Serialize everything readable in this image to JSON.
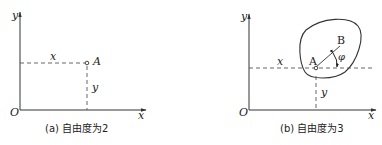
{
  "panels": [
    {
      "id": "a",
      "axis_y_label": "y",
      "axis_x_label": "x",
      "origin_label": "O",
      "point_label": "A",
      "dash_x_label": "x",
      "dash_y_label": "y",
      "caption": "(a) 自由度为2"
    },
    {
      "id": "b",
      "axis_y_label": "y",
      "axis_x_label": "x",
      "origin_label": "O",
      "point_a_label": "A",
      "point_b_label": "B",
      "angle_label": "φ",
      "dash_x_label": "x",
      "dash_y_label": "y",
      "caption": "(b) 自由度为3"
    }
  ],
  "colors": {
    "line": "#333333",
    "dash": "#555555",
    "background": "#ffffff"
  }
}
